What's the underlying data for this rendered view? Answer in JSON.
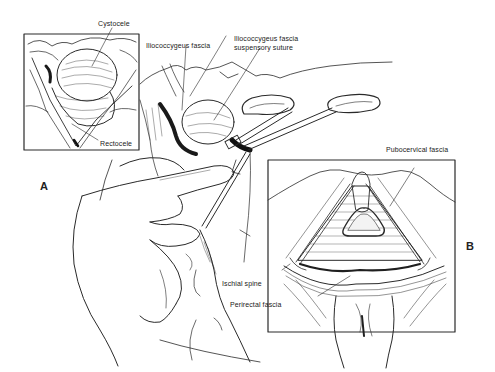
{
  "figure": {
    "panels": [
      {
        "id": "A",
        "label": "A"
      },
      {
        "id": "B",
        "label": "B"
      }
    ],
    "labels": {
      "cystocele": "Cystocele",
      "rectocele": "Rectocele",
      "iliococcygeus_fascia": "Iliococcygeus fascia",
      "suspensory_suture_line1": "Iliococcygeus fascia",
      "suspensory_suture_line2": "suspensory suture",
      "pubocervical_fascia": "Pubocervical fascia",
      "ischial_spine": "Ischial spine",
      "perirectal_fascia": "Perirectal fascia"
    },
    "colors": {
      "ink": "#2a2a2a",
      "background": "#ffffff"
    }
  }
}
